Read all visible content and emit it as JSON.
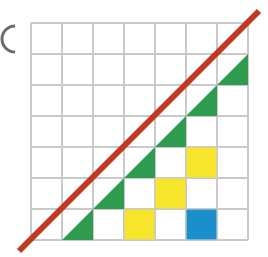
{
  "figure": {
    "type": "geometry-diagram",
    "canvas": {
      "width": 268,
      "height": 257,
      "background": "#ffffff"
    },
    "grid": {
      "columns": 7,
      "rows": 7,
      "cell_size": 31,
      "origin_x": 31,
      "origin_y": 23,
      "line_color": "#c9c9c9",
      "line_width": 1.1,
      "visible": true
    },
    "palette": {
      "green": "#2E9B4E",
      "yellow": "#F7E52B",
      "blue": "#1B8FCB",
      "red": "#C03A22",
      "grid_gray": "#c9c9c9",
      "background": "#ffffff"
    },
    "diagonal": {
      "label": "red diagonal line",
      "color": "#C03A22",
      "width": 6,
      "x1": 19,
      "y1": 251,
      "x2": 259,
      "y2": 11,
      "slope": -1,
      "note": "passes through grid corner to corner, extends past both ends"
    },
    "green_triangles": {
      "label": "green half-cell triangles under the diagonal",
      "color": "#2E9B4E",
      "description": "lower-right half of each diagonal cell",
      "cells": [
        {
          "col": 1,
          "row": 6
        },
        {
          "col": 2,
          "row": 5
        },
        {
          "col": 3,
          "row": 4
        },
        {
          "col": 4,
          "row": 3
        },
        {
          "col": 5,
          "row": 2
        },
        {
          "col": 6,
          "row": 1
        }
      ]
    },
    "yellow_squares": {
      "label": "yellow filled cells",
      "color": "#F7E52B",
      "count": 3,
      "cells": [
        {
          "col": 3,
          "row": 6
        },
        {
          "col": 4,
          "row": 5
        },
        {
          "col": 5,
          "row": 4
        }
      ]
    },
    "blue_squares": {
      "label": "blue filled cells",
      "color": "#1B8FCB",
      "count": 1,
      "cells": [
        {
          "col": 5,
          "row": 6
        }
      ]
    },
    "edge_mark": {
      "label": "partial dark arc clipped at left page edge",
      "color": "#4a4a4a",
      "x": 2,
      "y": 26,
      "radius": 13
    }
  },
  "legend": {
    "green_label": "Green",
    "yellow_label": "Yellow",
    "blue_label": "Blue",
    "red_label": "Red line"
  }
}
